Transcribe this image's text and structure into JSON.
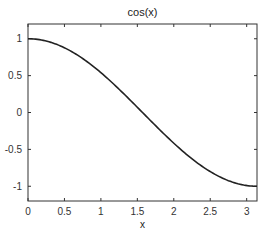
{
  "chart_data": {
    "type": "line",
    "title": "cos(x)",
    "xlabel": "x",
    "ylabel": "",
    "xlim": [
      0,
      3.14159
    ],
    "ylim": [
      -1.2,
      1.2
    ],
    "xticks": [
      0,
      0.5,
      1,
      1.5,
      2,
      2.5,
      3
    ],
    "xtick_labels": [
      "0",
      "0.5",
      "1",
      "1.5",
      "2",
      "2.5",
      "3"
    ],
    "yticks": [
      -1,
      -0.5,
      0,
      0.5,
      1
    ],
    "ytick_labels": [
      "-1",
      "-0.5",
      "0",
      "0.5",
      "1"
    ],
    "grid": false,
    "legend": null,
    "series": [
      {
        "name": "cos(x)",
        "color": "#222222",
        "x": [
          0,
          0.25,
          0.5,
          0.75,
          1.0,
          1.25,
          1.5,
          1.75,
          2.0,
          2.25,
          2.5,
          2.75,
          3.0,
          3.14159
        ],
        "y": [
          1.0,
          0.969,
          0.878,
          0.732,
          0.54,
          0.315,
          0.071,
          -0.178,
          -0.416,
          -0.628,
          -0.801,
          -0.924,
          -0.99,
          -1.0
        ]
      }
    ]
  }
}
